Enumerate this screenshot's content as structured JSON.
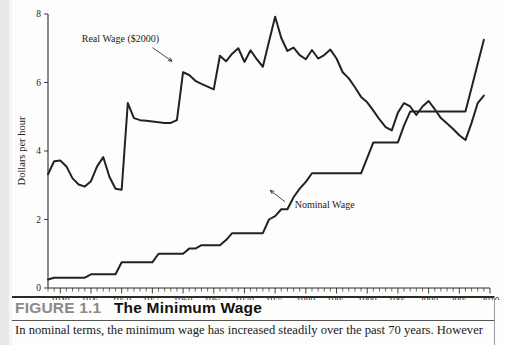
{
  "figure": {
    "number_label": "FIGURE 1.1",
    "title": "The Minimum Wage",
    "body_text": "In nominal terms, the minimum wage has increased steadily over the past 70 years. However"
  },
  "chart_data": {
    "type": "line",
    "title": "The Minimum Wage",
    "xlabel": "",
    "ylabel": "Dollars per hour",
    "xlim": [
      1938,
      2010
    ],
    "ylim": [
      0,
      8
    ],
    "yticks": [
      0,
      2,
      4,
      6,
      8
    ],
    "ytick_labels": [
      "0",
      "2",
      "4",
      "6",
      "8"
    ],
    "xticks": [
      1940,
      1945,
      1950,
      1955,
      1960,
      1965,
      1970,
      1975,
      1980,
      1985,
      1990,
      1995,
      2000,
      2005,
      2010
    ],
    "xtick_labels": [
      "1940",
      "1945",
      "1950",
      "1955",
      "1960",
      "1965",
      "1970",
      "1975",
      "1980",
      "1985",
      "1990",
      "1995",
      "2000",
      "2005",
      "2010"
    ],
    "minor_tick_interval": 1,
    "grid": false,
    "legend": "annotations",
    "annotations": [
      {
        "text": "Real Wage ($2000)",
        "series": "real_wage",
        "x": 1951,
        "y": 7.15
      },
      {
        "text": "Nominal Wage",
        "series": "nominal_wage",
        "x": 1978,
        "y": 2.25
      }
    ],
    "x": [
      1938,
      1939,
      1940,
      1941,
      1942,
      1943,
      1944,
      1945,
      1946,
      1947,
      1948,
      1949,
      1950,
      1951,
      1952,
      1953,
      1954,
      1955,
      1956,
      1957,
      1958,
      1959,
      1960,
      1961,
      1962,
      1963,
      1964,
      1965,
      1966,
      1967,
      1968,
      1969,
      1970,
      1971,
      1972,
      1973,
      1974,
      1975,
      1976,
      1977,
      1978,
      1979,
      1980,
      1981,
      1982,
      1983,
      1984,
      1985,
      1986,
      1987,
      1988,
      1989,
      1990,
      1991,
      1992,
      1993,
      1994,
      1995,
      1996,
      1997,
      1998,
      1999,
      2000,
      2001,
      2002,
      2003,
      2004,
      2005,
      2006,
      2007,
      2008,
      2009
    ],
    "series": [
      {
        "name": "Real Wage ($2000)",
        "units": "2000 dollars per hour",
        "values": [
          3.32,
          3.7,
          3.72,
          3.55,
          3.2,
          3.02,
          2.96,
          3.12,
          3.55,
          3.82,
          3.25,
          2.9,
          2.87,
          5.4,
          4.96,
          4.9,
          4.88,
          4.86,
          4.84,
          4.82,
          4.82,
          4.9,
          6.3,
          6.22,
          6.05,
          5.96,
          5.88,
          5.8,
          6.78,
          6.62,
          6.84,
          7.0,
          6.6,
          6.94,
          6.68,
          6.46,
          7.2,
          7.92,
          7.3,
          6.92,
          7.02,
          6.8,
          6.68,
          6.95,
          6.7,
          6.8,
          6.96,
          6.7,
          6.3,
          6.12,
          5.86,
          5.58,
          5.42,
          5.18,
          4.92,
          4.7,
          4.6,
          5.12,
          5.4,
          5.3,
          5.05,
          5.3,
          5.46,
          5.22,
          4.96,
          4.8,
          4.64,
          4.46,
          4.32,
          4.82,
          5.4,
          5.62
        ]
      },
      {
        "name": "Nominal Wage",
        "units": "current dollars per hour",
        "values": [
          0.25,
          0.3,
          0.3,
          0.3,
          0.3,
          0.3,
          0.3,
          0.4,
          0.4,
          0.4,
          0.4,
          0.4,
          0.75,
          0.75,
          0.75,
          0.75,
          0.75,
          0.75,
          1.0,
          1.0,
          1.0,
          1.0,
          1.0,
          1.15,
          1.15,
          1.25,
          1.25,
          1.25,
          1.25,
          1.4,
          1.6,
          1.6,
          1.6,
          1.6,
          1.6,
          1.6,
          2.0,
          2.1,
          2.3,
          2.3,
          2.65,
          2.9,
          3.1,
          3.35,
          3.35,
          3.35,
          3.35,
          3.35,
          3.35,
          3.35,
          3.35,
          3.35,
          3.8,
          4.25,
          4.25,
          4.25,
          4.25,
          4.25,
          4.75,
          5.15,
          5.15,
          5.15,
          5.15,
          5.15,
          5.15,
          5.15,
          5.15,
          5.15,
          5.15,
          5.85,
          6.55,
          7.25
        ]
      }
    ]
  },
  "axis": {
    "y_title": "Dollars per hour"
  }
}
